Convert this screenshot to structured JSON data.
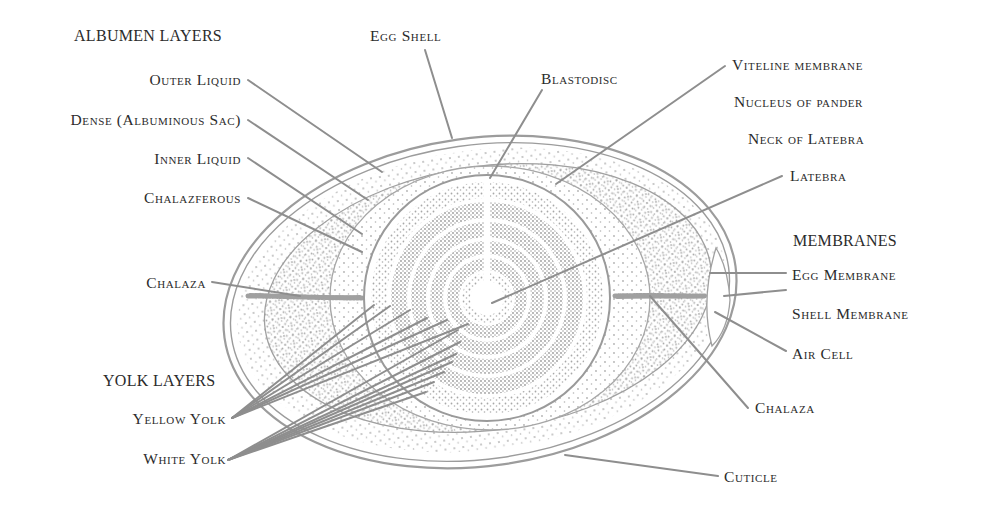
{
  "diagram": {
    "colors": {
      "line": "#9a9a9a",
      "stipple": "#a8a8a8",
      "text": "#2b2b2b",
      "background": "#ffffff"
    },
    "headings": {
      "albumen": "ALBUMEN LAYERS",
      "yolk": "YOLK LAYERS",
      "membranes": "MEMBRANES"
    },
    "labels": {
      "outer_liquid": "Outer Liquid",
      "dense": "Dense (Albuminous Sac)",
      "inner_liquid": "Inner Liquid",
      "chalazferous": "Chalazferous",
      "chalaza_left": "Chalaza",
      "yellow_yolk": "Yellow Yolk",
      "white_yolk": "White Yolk",
      "egg_shell": "Egg Shell",
      "blastodisc": "Blastodisc",
      "viteline_membrane": "Viteline membrane",
      "nucleus_of_pander": "Nucleus of pander",
      "neck_of_latebra": "Neck of Latebra",
      "latebra": "Latebra",
      "egg_membrane": "Egg Membrane",
      "shell_membrane": "Shell Membrane",
      "air_cell": "Air Cell",
      "chalaza_right": "Chalaza",
      "cuticle": "Cuticle"
    }
  }
}
